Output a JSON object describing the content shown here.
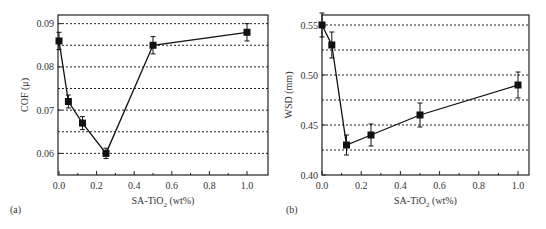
{
  "chart_data": [
    {
      "type": "line",
      "panel_label": "(a)",
      "title": "",
      "xlabel": "SA-TiO2 (wt%)",
      "ylabel": "COF (μ)",
      "xlim": [
        0.0,
        1.05
      ],
      "ylim": [
        0.055,
        0.092
      ],
      "xticks": [
        "0.0",
        "0.2",
        "0.4",
        "0.6",
        "0.8",
        "1.0"
      ],
      "yticks": [
        "0.06",
        "0.07",
        "0.08",
        "0.09"
      ],
      "grid": "horizontal dashed at 0.005 intervals",
      "x": [
        0.0,
        0.05,
        0.125,
        0.25,
        0.5,
        1.0
      ],
      "values": [
        0.086,
        0.072,
        0.067,
        0.06,
        0.085,
        0.088
      ],
      "errors": [
        0.002,
        0.0015,
        0.0015,
        0.0012,
        0.002,
        0.002
      ]
    },
    {
      "type": "line",
      "panel_label": "(b)",
      "title": "",
      "xlabel": "SA-TiO2 (wt%)",
      "ylabel": "WSD (mm)",
      "xlim": [
        0.0,
        1.05
      ],
      "ylim": [
        0.4,
        0.56
      ],
      "xticks": [
        "0.0",
        "0.2",
        "0.4",
        "0.6",
        "0.8",
        "1.0"
      ],
      "yticks": [
        "0.40",
        "0.45",
        "0.50",
        "0.55"
      ],
      "grid": "horizontal dashed at 0.025 intervals",
      "x": [
        0.0,
        0.05,
        0.125,
        0.25,
        0.5,
        1.0
      ],
      "values": [
        0.55,
        0.53,
        0.43,
        0.44,
        0.46,
        0.49
      ],
      "errors": [
        0.012,
        0.013,
        0.01,
        0.011,
        0.012,
        0.013
      ]
    }
  ]
}
